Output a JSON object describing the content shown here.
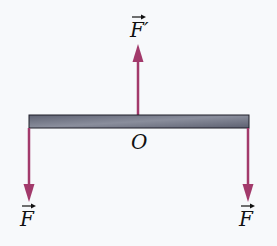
{
  "diagram": {
    "colors": {
      "arrow": "#a23a6b",
      "beam_fill": "#6e7282",
      "beam_stroke": "#1e1e28",
      "background": "#f7f9fb"
    },
    "beam": {
      "x1": 29,
      "x2": 249,
      "y_top": 115,
      "y_bottom": 128
    },
    "center_label": "O",
    "forces": [
      {
        "id": "f-prime",
        "label": "F′",
        "direction": "up",
        "x": 138
      },
      {
        "id": "f-left",
        "label": "F",
        "direction": "down",
        "x": 29
      },
      {
        "id": "f-right",
        "label": "F",
        "direction": "down",
        "x": 248
      }
    ]
  }
}
